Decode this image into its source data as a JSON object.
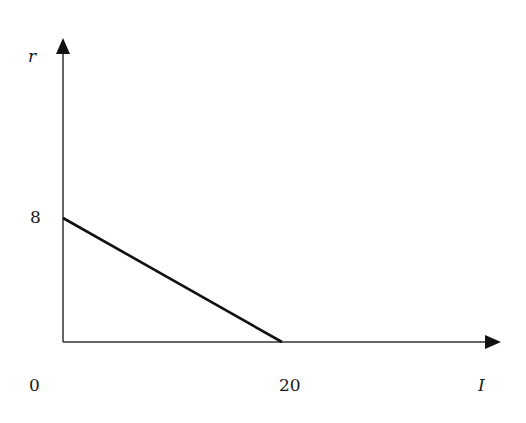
{
  "chart_data": {
    "type": "line",
    "title": "",
    "xlabel": "I",
    "ylabel": "r",
    "xlim": [
      0,
      22.5
    ],
    "ylim": [
      0,
      17
    ],
    "grid": false,
    "legend": null,
    "x_ticks": [
      {
        "value": 0,
        "label": "0"
      },
      {
        "value": 20,
        "label": "20"
      }
    ],
    "y_ticks": [
      {
        "value": 8,
        "label": "8"
      }
    ],
    "series": [
      {
        "name": "r vs I",
        "x": [
          0,
          20
        ],
        "y": [
          8,
          0
        ],
        "color": "#111111"
      }
    ]
  },
  "labels": {
    "y_axis": "r",
    "x_axis": "I",
    "origin": "0",
    "y_tick_8": "8",
    "x_tick_20": "20"
  }
}
